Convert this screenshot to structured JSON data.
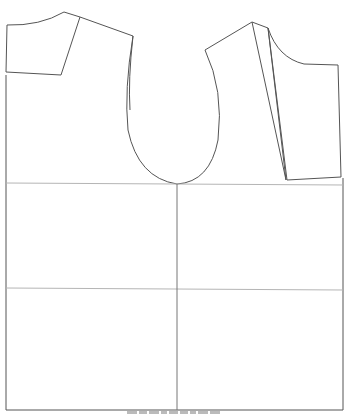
{
  "diagram": {
    "type": "sewing pattern layout",
    "stroke_color": "#555555",
    "grid_color": "#b5b5b5",
    "pieces": [
      {
        "name": "back-shoulder-yoke"
      },
      {
        "name": "sleeve-shoulder-piece"
      },
      {
        "name": "front-armhole-curve-piece"
      },
      {
        "name": "front-panel-narrow"
      },
      {
        "name": "front-bodice-right"
      },
      {
        "name": "main-body-rectangle"
      }
    ],
    "grid": {
      "horizontal_lines_y": [
        183,
        289
      ],
      "vertical_line_x": 177
    }
  },
  "caption": {
    "text": ""
  }
}
